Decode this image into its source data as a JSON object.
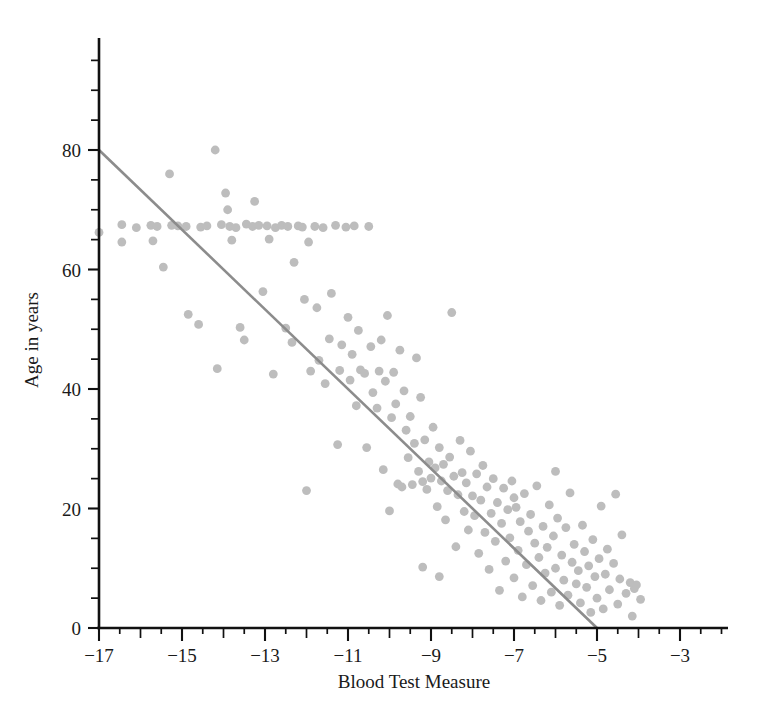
{
  "chart_data": {
    "type": "scatter",
    "title": "",
    "xlabel": "Blood Test Measure",
    "ylabel": "Age in years",
    "xlim": [
      -17.45,
      -2.25
    ],
    "ylim": [
      0,
      95
    ],
    "grid": false,
    "legend": "none",
    "x_ticks_major": [
      -17,
      -15,
      -13,
      -11,
      -9,
      -7,
      -5,
      -3
    ],
    "x_tick_labels": [
      "-17",
      "-15",
      "-13",
      "-11",
      "-9",
      "-7",
      "-5",
      "-3"
    ],
    "x_minor_tick_step": 0.5,
    "y_ticks_major": [
      0,
      20,
      40,
      60,
      80
    ],
    "y_tick_labels": [
      "0",
      "20",
      "40",
      "60",
      "80"
    ],
    "y_minor_tick_step": 5,
    "point_color": "#bdbdbd",
    "line_color": "#8c8c8c",
    "axis_color": "#111111",
    "marker_radius_px": 4.4,
    "fit_line": {
      "label": "least-squares regression line",
      "x_start": -17.0,
      "y_start": 80.0,
      "x_end": -5.0,
      "y_end": 0.0,
      "slope": -6.667,
      "intercept": -33.33
    },
    "n_points": 198,
    "points": [
      [
        -17.0,
        66.2
      ],
      [
        -16.45,
        67.5
      ],
      [
        -16.45,
        64.6
      ],
      [
        -16.1,
        67.0
      ],
      [
        -15.75,
        67.4
      ],
      [
        -15.7,
        64.8
      ],
      [
        -15.6,
        67.2
      ],
      [
        -15.45,
        60.4
      ],
      [
        -15.3,
        76.0
      ],
      [
        -15.25,
        67.4
      ],
      [
        -15.1,
        67.3
      ],
      [
        -14.9,
        67.2
      ],
      [
        -14.85,
        52.5
      ],
      [
        -14.6,
        50.8
      ],
      [
        -14.55,
        67.1
      ],
      [
        -14.4,
        67.3
      ],
      [
        -14.2,
        80.0
      ],
      [
        -14.15,
        43.4
      ],
      [
        -14.05,
        67.5
      ],
      [
        -13.95,
        72.8
      ],
      [
        -13.9,
        70.0
      ],
      [
        -13.85,
        67.2
      ],
      [
        -13.8,
        64.9
      ],
      [
        -13.7,
        67.0
      ],
      [
        -13.6,
        50.3
      ],
      [
        -13.5,
        48.2
      ],
      [
        -13.45,
        67.6
      ],
      [
        -13.3,
        67.2
      ],
      [
        -13.25,
        71.4
      ],
      [
        -13.15,
        67.4
      ],
      [
        -13.05,
        56.3
      ],
      [
        -12.95,
        67.3
      ],
      [
        -12.9,
        65.1
      ],
      [
        -12.8,
        42.5
      ],
      [
        -12.75,
        67.0
      ],
      [
        -12.6,
        67.4
      ],
      [
        -12.5,
        50.2
      ],
      [
        -12.45,
        67.2
      ],
      [
        -12.35,
        47.8
      ],
      [
        -12.3,
        61.2
      ],
      [
        -12.2,
        67.3
      ],
      [
        -12.1,
        67.1
      ],
      [
        -12.05,
        55.0
      ],
      [
        -11.95,
        64.6
      ],
      [
        -11.9,
        43.0
      ],
      [
        -11.8,
        67.2
      ],
      [
        -11.75,
        53.6
      ],
      [
        -11.7,
        44.8
      ],
      [
        -11.6,
        67.0
      ],
      [
        -11.55,
        40.9
      ],
      [
        -11.45,
        48.4
      ],
      [
        -11.4,
        56.0
      ],
      [
        -11.3,
        67.4
      ],
      [
        -11.25,
        30.7
      ],
      [
        -11.2,
        43.1
      ],
      [
        -11.15,
        47.4
      ],
      [
        -11.05,
        67.1
      ],
      [
        -11.0,
        52.0
      ],
      [
        -10.95,
        41.5
      ],
      [
        -10.9,
        45.8
      ],
      [
        -10.85,
        67.3
      ],
      [
        -10.8,
        37.2
      ],
      [
        -10.75,
        49.8
      ],
      [
        -10.7,
        43.2
      ],
      [
        -10.6,
        42.6
      ],
      [
        -10.55,
        30.2
      ],
      [
        -10.5,
        67.2
      ],
      [
        -10.45,
        47.1
      ],
      [
        -10.4,
        39.4
      ],
      [
        -10.3,
        36.8
      ],
      [
        -10.25,
        43.0
      ],
      [
        -10.2,
        48.2
      ],
      [
        -10.15,
        26.5
      ],
      [
        -10.1,
        41.3
      ],
      [
        -10.05,
        52.3
      ],
      [
        -9.95,
        35.2
      ],
      [
        -9.9,
        42.8
      ],
      [
        -9.85,
        37.5
      ],
      [
        -9.8,
        24.1
      ],
      [
        -9.75,
        46.5
      ],
      [
        -9.7,
        23.6
      ],
      [
        -9.65,
        39.7
      ],
      [
        -9.6,
        33.1
      ],
      [
        -9.55,
        28.5
      ],
      [
        -9.5,
        35.4
      ],
      [
        -9.45,
        24.0
      ],
      [
        -9.4,
        30.9
      ],
      [
        -9.35,
        45.2
      ],
      [
        -9.3,
        26.2
      ],
      [
        -9.25,
        38.6
      ],
      [
        -9.2,
        24.5
      ],
      [
        -9.15,
        31.5
      ],
      [
        -9.1,
        23.2
      ],
      [
        -9.05,
        27.8
      ],
      [
        -9.0,
        25.1
      ],
      [
        -8.95,
        33.6
      ],
      [
        -8.9,
        26.8
      ],
      [
        -8.85,
        20.3
      ],
      [
        -8.8,
        30.2
      ],
      [
        -8.75,
        24.6
      ],
      [
        -8.7,
        27.4
      ],
      [
        -8.65,
        18.1
      ],
      [
        -8.6,
        23.0
      ],
      [
        -8.55,
        28.6
      ],
      [
        -8.5,
        52.8
      ],
      [
        -8.45,
        25.4
      ],
      [
        -8.4,
        13.6
      ],
      [
        -8.35,
        22.3
      ],
      [
        -8.3,
        31.4
      ],
      [
        -8.25,
        26.0
      ],
      [
        -8.2,
        19.5
      ],
      [
        -8.15,
        24.3
      ],
      [
        -8.1,
        16.4
      ],
      [
        -8.05,
        29.6
      ],
      [
        -8.0,
        22.1
      ],
      [
        -7.95,
        18.8
      ],
      [
        -7.9,
        25.8
      ],
      [
        -7.85,
        12.5
      ],
      [
        -7.8,
        21.4
      ],
      [
        -7.75,
        27.2
      ],
      [
        -7.7,
        16.0
      ],
      [
        -7.65,
        23.6
      ],
      [
        -7.6,
        9.8
      ],
      [
        -7.55,
        19.2
      ],
      [
        -7.5,
        25.0
      ],
      [
        -7.45,
        14.5
      ],
      [
        -7.4,
        21.0
      ],
      [
        -7.35,
        6.3
      ],
      [
        -7.3,
        17.5
      ],
      [
        -7.25,
        23.4
      ],
      [
        -7.2,
        11.2
      ],
      [
        -7.15,
        19.8
      ],
      [
        -7.1,
        15.1
      ],
      [
        -7.05,
        24.6
      ],
      [
        -7.0,
        8.4
      ],
      [
        -6.95,
        20.2
      ],
      [
        -6.9,
        13.0
      ],
      [
        -6.85,
        17.8
      ],
      [
        -6.8,
        5.2
      ],
      [
        -6.75,
        22.5
      ],
      [
        -6.7,
        10.6
      ],
      [
        -6.65,
        16.2
      ],
      [
        -6.6,
        19.0
      ],
      [
        -6.55,
        7.1
      ],
      [
        -6.5,
        14.2
      ],
      [
        -6.45,
        23.8
      ],
      [
        -6.4,
        11.8
      ],
      [
        -6.35,
        4.6
      ],
      [
        -6.3,
        17.0
      ],
      [
        -6.25,
        9.2
      ],
      [
        -6.2,
        13.5
      ],
      [
        -6.15,
        20.6
      ],
      [
        -6.1,
        6.0
      ],
      [
        -6.05,
        15.4
      ],
      [
        -6.0,
        10.0
      ],
      [
        -5.95,
        18.4
      ],
      [
        -5.9,
        3.8
      ],
      [
        -5.85,
        12.2
      ],
      [
        -5.8,
        8.0
      ],
      [
        -5.75,
        16.8
      ],
      [
        -5.7,
        5.5
      ],
      [
        -5.65,
        22.6
      ],
      [
        -5.6,
        11.0
      ],
      [
        -5.55,
        14.0
      ],
      [
        -5.5,
        7.4
      ],
      [
        -5.45,
        9.6
      ],
      [
        -5.4,
        4.2
      ],
      [
        -5.35,
        17.2
      ],
      [
        -5.3,
        12.8
      ],
      [
        -5.25,
        6.8
      ],
      [
        -5.2,
        10.4
      ],
      [
        -5.15,
        2.6
      ],
      [
        -5.1,
        14.8
      ],
      [
        -5.05,
        8.6
      ],
      [
        -5.0,
        5.0
      ],
      [
        -4.95,
        11.6
      ],
      [
        -4.9,
        20.4
      ],
      [
        -4.85,
        3.2
      ],
      [
        -4.8,
        9.0
      ],
      [
        -4.75,
        13.2
      ],
      [
        -4.7,
        6.4
      ],
      [
        -4.6,
        10.8
      ],
      [
        -4.55,
        22.4
      ],
      [
        -4.5,
        4.0
      ],
      [
        -4.45,
        8.2
      ],
      [
        -4.4,
        15.6
      ],
      [
        -4.3,
        5.8
      ],
      [
        -4.2,
        7.6
      ],
      [
        -4.15,
        2.0
      ],
      [
        -4.1,
        6.6
      ],
      [
        -4.05,
        7.2
      ],
      [
        -3.95,
        4.8
      ],
      [
        -12.0,
        23.0
      ],
      [
        -10.0,
        19.6
      ],
      [
        -7.0,
        21.8
      ],
      [
        -8.8,
        8.6
      ],
      [
        -6.0,
        26.2
      ],
      [
        -9.2,
        10.2
      ]
    ]
  },
  "geometry": {
    "plot_left_px": 99,
    "plot_bottom_px": 628,
    "x_scale_px_per_unit": 41.5,
    "y_scale_px_per_unit": 5.975,
    "y_axis_top_px": 38,
    "x_axis_right_px": 728
  }
}
